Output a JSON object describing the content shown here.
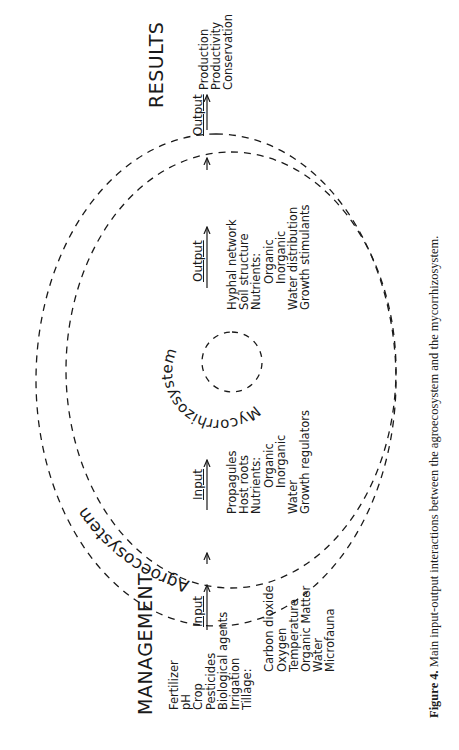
{
  "diagram": {
    "orientation": "rotated 90 degrees counter-clockwise",
    "management": {
      "heading": "MANAGEMENT",
      "input_label": "Input",
      "items": [
        "Fertilizer",
        "pH",
        "Crop",
        "Pesticides",
        "Biological agents",
        "Irrigation",
        "Tillage:"
      ],
      "tillage_subitems": [
        "Carbon dioxide",
        "Oxygen",
        "Temperature",
        "Organic Matter",
        "Water",
        "Microfauna"
      ]
    },
    "agroecosystem": {
      "label": "Agroecosystem"
    },
    "mycorrhizosystem": {
      "label": "Mycorrhizosystem",
      "input": {
        "label": "Input",
        "items": [
          "Propagules",
          "Host roots",
          "Nutrients:",
          "Organic",
          "Inorganic",
          "Water",
          "Growth regulators"
        ]
      },
      "output": {
        "label": "Output",
        "items": [
          "Hyphal network",
          "Soil structure",
          "Nutrients:",
          "Organic",
          "Inorganic",
          "Water distribution",
          "Growth stimulants"
        ]
      }
    },
    "results": {
      "heading": "RESULTS",
      "output_label": "Output",
      "items": [
        "Production",
        "Productivity",
        "Conservation"
      ]
    }
  },
  "caption": {
    "label": "Figure 4.",
    "text": " Main input-output interactions between the agroecosystem and the mycorrhizosystem."
  }
}
